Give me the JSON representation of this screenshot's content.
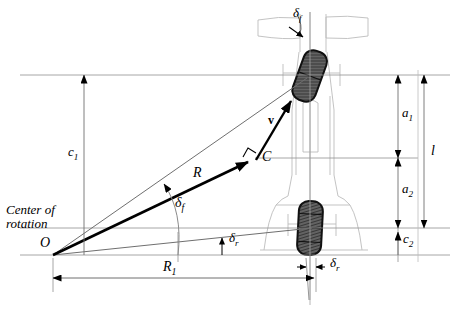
{
  "figure": {
    "type": "engineering-diagram"
  },
  "colors": {
    "ink": "#000000",
    "body_outline": "#b9b9b9",
    "construction_line": "#8a8a8a",
    "tire_fill": "#5a5a5a",
    "tire_stroke": "#1a1a1a",
    "background": "#ffffff"
  },
  "labels": {
    "center_of_rotation_line1": "Center of",
    "center_of_rotation_line2": "rotation",
    "origin_point": "O",
    "mass_center_point": "C",
    "velocity_vector": "v",
    "turn_radius": "R",
    "front_steer_angle_top": "δ",
    "front_steer_angle_top_sub": "f",
    "front_steer_angle_arc": "δ",
    "front_steer_angle_arc_sub": "f",
    "rear_steer_angle_mid": "δ",
    "rear_steer_angle_mid_sub": "r",
    "rear_steer_angle_bottom": "δ",
    "rear_steer_angle_bottom_sub": "r",
    "dim_c1": "c",
    "dim_c1_sub": "1",
    "dim_c2": "c",
    "dim_c2_sub": "2",
    "dim_a1": "a",
    "dim_a1_sub": "1",
    "dim_a2": "a",
    "dim_a2_sub": "2",
    "dim_l": "l",
    "dim_R1": "R",
    "dim_R1_sub": "1"
  },
  "geometry": {
    "origin": {
      "x": 53,
      "y": 255
    },
    "mass_center": {
      "x": 255,
      "y": 158
    },
    "front_axle_y": 75,
    "rear_axle_y": 228,
    "baseline_y": 255,
    "vehicle_centerline_x": 310,
    "R1_dim_y": 278,
    "R1_span": {
      "x1": 53,
      "x2": 310
    },
    "c1_dim_x": 84,
    "c1_span": {
      "y1": 75,
      "y2": 255
    },
    "a_dim_x": 398,
    "l_dim_x": 424,
    "front_wheel_angle_deg": 20,
    "rear_wheel_angle_deg": 3
  },
  "annotations": {
    "right_angle_marker_at_C": true,
    "arc_for_delta_f": true
  }
}
